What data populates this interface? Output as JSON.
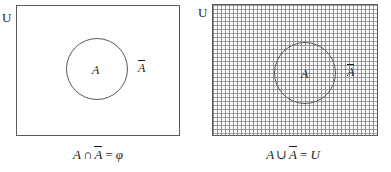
{
  "figure": {
    "panels": [
      {
        "id": "intersection-panel",
        "universe_label": "U",
        "set_label": "A",
        "complement_label": "A",
        "complement_has_overline": true,
        "shading": "none",
        "caption": {
          "full": "A ∩ A̅ = φ",
          "left_operand": "A",
          "operator": "∩",
          "right_operand": "A",
          "equals": "=",
          "result": "φ"
        }
      },
      {
        "id": "union-panel",
        "universe_label": "U",
        "set_label": "A",
        "complement_label": "A",
        "complement_has_overline": true,
        "shading": "dotted-grid",
        "caption": {
          "full": "A ∪ A̅ = U",
          "left_operand": "A",
          "operator": "∪",
          "right_operand": "A",
          "equals": "=",
          "result": "U"
        }
      }
    ]
  },
  "colors": {
    "stroke": "#5a5a5a",
    "text": "#1a1a1a",
    "shading_dot": "#9a9a9a",
    "background": "#ffffff"
  }
}
